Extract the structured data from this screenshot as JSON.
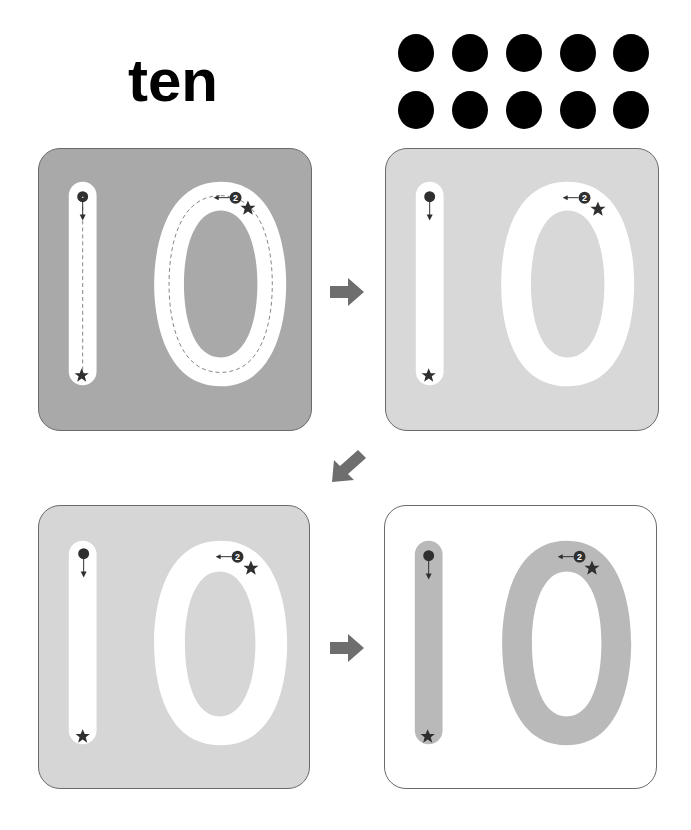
{
  "worksheet": {
    "number_word": "ten",
    "number": 10,
    "dot_count": 10,
    "dot_rows": 2,
    "dot_columns": 5,
    "colors": {
      "dot": "#000000",
      "panel_dark": "#a9a9a9",
      "panel_light": "#d6d6d6",
      "panel_lighter": "#dcdcdc",
      "panel_white": "#ffffff",
      "trace_gray": "#b9b9b9",
      "arrow": "#6e6e6e",
      "marker": "#2f2f2f"
    }
  },
  "steps": [
    {
      "label": "Step 1 - trace dashed guide",
      "stroke_marker_1": "1",
      "stroke_marker_2": "2",
      "dashed_guide": true
    },
    {
      "label": "Step 2 - trace without guide",
      "stroke_marker_1": "1",
      "stroke_marker_2": "2",
      "dashed_guide": false
    },
    {
      "label": "Step 3 - trace without guide",
      "stroke_marker_1": "1",
      "stroke_marker_2": "2",
      "dashed_guide": false
    },
    {
      "label": "Step 4 - write on gray shape",
      "stroke_marker_1": "1",
      "stroke_marker_2": "2",
      "dashed_guide": false
    }
  ]
}
